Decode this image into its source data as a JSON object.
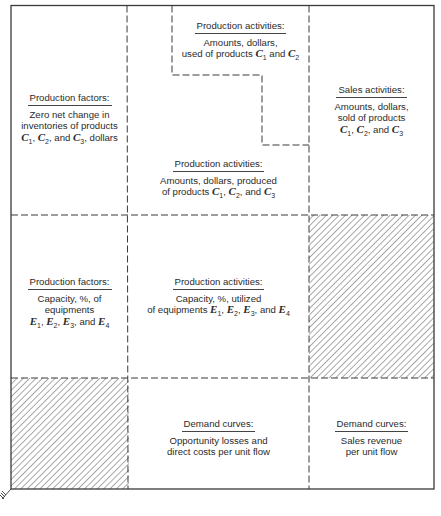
{
  "diagram": {
    "cells": {
      "production_factors_inventory": {
        "title": "Production factors:",
        "lines": [
          "Zero net change in",
          "inventories of products",
          "{C1}, {C2}, and {C3}, dollars"
        ]
      },
      "production_activities_used": {
        "title": "Production activities:",
        "lines": [
          "Amounts, dollars,",
          "used of products {C1} and {C2}"
        ]
      },
      "production_activities_produced": {
        "title": "Production activities:",
        "lines": [
          "Amounts, dollars, produced",
          "of products {C1}, {C2}, and {C3}"
        ]
      },
      "sales_activities": {
        "title": "Sales activities:",
        "lines": [
          "Amounts, dollars,",
          "sold of products",
          "{C1}, {C2}, and {C3}"
        ]
      },
      "production_factors_capacity": {
        "title": "Production factors:",
        "lines": [
          "Capacity, %, of",
          "equipments",
          "{E1}, {E2}, {E3}, and {E4}"
        ]
      },
      "production_activities_capacity": {
        "title": "Production activities:",
        "lines": [
          "Capacity, %, utilized",
          "of equipments {E1}, {E2}, {E3}, and {E4}"
        ]
      },
      "demand_curves_costs": {
        "title": "Demand curves:",
        "lines": [
          "Opportunity losses and",
          "direct costs per unit flow"
        ]
      },
      "demand_curves_revenue": {
        "title": "Demand curves:",
        "lines": [
          "Sales revenue",
          "per unit flow"
        ]
      }
    },
    "hatched_cells": [
      "sales-x-capacity",
      "factors-x-demand"
    ],
    "colors": {
      "line": "#3a3a3a",
      "hatch": "#555555",
      "text": "#2b2b2b"
    }
  }
}
